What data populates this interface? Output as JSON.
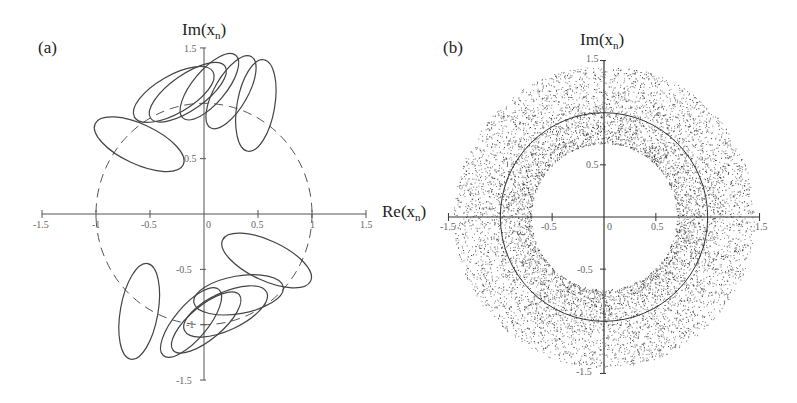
{
  "chart_data": [
    {
      "type": "line",
      "panel_label": "(a)",
      "title": "",
      "xlabel": "Re(x_n)",
      "ylabel": "Im(x_n)",
      "xlim": [
        -1.5,
        1.5
      ],
      "ylim": [
        -1.5,
        1.5
      ],
      "x_ticks": [
        "-1.5",
        "-1",
        "-0.5",
        "0",
        "0.5",
        "1",
        "1.5"
      ],
      "y_ticks": [
        "1.5",
        "0.5",
        "-0.5",
        "-1",
        "-1.5"
      ],
      "grid": false,
      "series": [
        {
          "name": "unit circle",
          "style": "dashed",
          "shape": "circle",
          "center": [
            0,
            0
          ],
          "radius": 1.0
        },
        {
          "name": "orbit loops",
          "style": "solid",
          "shape": "closed-loops",
          "loops": [
            {
              "cx": -0.6,
              "cy": 0.63,
              "rx": 0.45,
              "ry": 0.18,
              "angle_deg": -25
            },
            {
              "cx": -0.28,
              "cy": 1.08,
              "rx": 0.42,
              "ry": 0.17,
              "angle_deg": 30
            },
            {
              "cx": -0.15,
              "cy": 1.1,
              "rx": 0.42,
              "ry": 0.16,
              "angle_deg": 35
            },
            {
              "cx": 0.05,
              "cy": 1.15,
              "rx": 0.38,
              "ry": 0.15,
              "angle_deg": 50
            },
            {
              "cx": 0.25,
              "cy": 1.1,
              "rx": 0.38,
              "ry": 0.15,
              "angle_deg": 60
            },
            {
              "cx": 0.48,
              "cy": 0.98,
              "rx": 0.43,
              "ry": 0.17,
              "angle_deg": 80
            },
            {
              "cx": 0.58,
              "cy": -0.42,
              "rx": 0.45,
              "ry": 0.18,
              "angle_deg": -25
            },
            {
              "cx": 0.32,
              "cy": -0.73,
              "rx": 0.42,
              "ry": 0.17,
              "angle_deg": 10
            },
            {
              "cx": 0.2,
              "cy": -0.88,
              "rx": 0.42,
              "ry": 0.17,
              "angle_deg": 25
            },
            {
              "cx": 0.02,
              "cy": -0.98,
              "rx": 0.4,
              "ry": 0.15,
              "angle_deg": 40
            },
            {
              "cx": -0.12,
              "cy": -0.98,
              "rx": 0.4,
              "ry": 0.15,
              "angle_deg": 50
            },
            {
              "cx": -0.6,
              "cy": -0.88,
              "rx": 0.45,
              "ry": 0.17,
              "angle_deg": 80
            }
          ]
        }
      ]
    },
    {
      "type": "scatter",
      "panel_label": "(b)",
      "title": "",
      "xlabel": "Re(x_n)",
      "ylabel": "Im(x_n)",
      "xlim": [
        -1.5,
        1.5
      ],
      "ylim": [
        -1.5,
        1.5
      ],
      "x_ticks": [
        "-1.5",
        "-0.5",
        "0",
        "0.5",
        "1.5"
      ],
      "y_ticks": [
        "1.5",
        "0.5",
        "-0.5",
        "-1.5"
      ],
      "grid": false,
      "series": [
        {
          "name": "scatter annulus",
          "style": "points",
          "inner_radius": 0.7,
          "outer_radius": 1.45,
          "density": "denser near inner edge"
        },
        {
          "name": "reference circle",
          "style": "solid",
          "shape": "circle",
          "center": [
            0,
            0
          ],
          "radius": 1.0
        }
      ]
    }
  ],
  "labels": {
    "a": {
      "panel": "(a)",
      "ylabel_main": "Im(x",
      "ylabel_sub": "n",
      "ylabel_end": ")",
      "ticks": {
        "xm15": "-1.5",
        "xm1": "-1",
        "xm05": "-0.5",
        "x0": "0",
        "x05": "0.5",
        "x1": "1",
        "x15": "1.5",
        "y15": "1.5",
        "y05": "0.5",
        "ym05": "-0.5",
        "ym1": "-1",
        "ym15": "-1.5"
      }
    },
    "b": {
      "panel": "(b)",
      "ylabel_main": "Im(x",
      "ylabel_sub": "n",
      "ylabel_end": ")",
      "xlabel_main": "Re(x",
      "xlabel_sub": "n",
      "xlabel_end": ")",
      "ticks": {
        "xm15": "-1.5",
        "xm05": "-0.5",
        "x0": "0",
        "x05": "0.5",
        "x15": "1.5",
        "y15": "1.5",
        "y05": "0.5",
        "ym05": "-0.5",
        "ym15": "-1.5"
      }
    }
  }
}
